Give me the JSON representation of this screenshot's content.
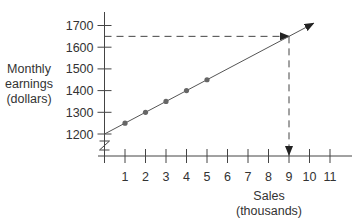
{
  "chart_data": {
    "type": "scatter",
    "title": "",
    "xlabel": "Sales (thousands)",
    "xlabel_lines": [
      "Sales",
      "(thousands)"
    ],
    "ylabel": "Monthly earnings (dollars)",
    "ylabel_lines": [
      "Monthly",
      "earnings",
      "(dollars)"
    ],
    "x_ticks": [
      1,
      2,
      3,
      4,
      5,
      6,
      7,
      8,
      9,
      10,
      11
    ],
    "y_ticks": [
      1200,
      1300,
      1400,
      1500,
      1600,
      1700
    ],
    "xlim": [
      0,
      12
    ],
    "ylim": [
      1150,
      1750
    ],
    "y_axis_break": true,
    "grid": false,
    "series": [
      {
        "name": "observed",
        "type": "scatter",
        "x": [
          1,
          2,
          3,
          4,
          5
        ],
        "y": [
          1250,
          1300,
          1350,
          1400,
          1450
        ]
      },
      {
        "name": "trend line",
        "type": "line",
        "x": [
          0,
          10.2
        ],
        "y": [
          1200,
          1710
        ],
        "arrow_end": true
      }
    ],
    "annotations": [
      {
        "type": "dashed-arrow",
        "from": [
          0,
          1650
        ],
        "to": [
          9,
          1650
        ],
        "description": "horizontal dashed line at 1650 pointing to line"
      },
      {
        "type": "dashed-arrow",
        "from": [
          9,
          1650
        ],
        "to": [
          9,
          1150
        ],
        "description": "vertical dashed line down to x = 9"
      }
    ],
    "colors": {
      "axis": "#444444",
      "line": "#555555",
      "points": "#666666",
      "dashes": "#444444"
    }
  }
}
